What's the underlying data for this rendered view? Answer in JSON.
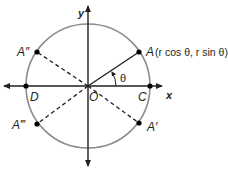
{
  "diagram": {
    "type": "unit-circle-reflections",
    "colors": {
      "circle": "#8c8c8c",
      "axes": "#231f20",
      "radius": "#231f20",
      "dashed": "#231f20",
      "points": "#000000"
    },
    "axes": {
      "x_label": "x",
      "y_label": "y"
    },
    "origin_label": "O",
    "angle_label": "θ",
    "points": {
      "A": {
        "label": "A",
        "coords_text": "(r cos θ, r sin θ)"
      },
      "A_prime": {
        "label": "A′"
      },
      "A_double_prime": {
        "label": "A″"
      },
      "A_triple_prime": {
        "label": "A‴"
      },
      "C": {
        "label": "C"
      },
      "D": {
        "label": "D"
      }
    }
  }
}
